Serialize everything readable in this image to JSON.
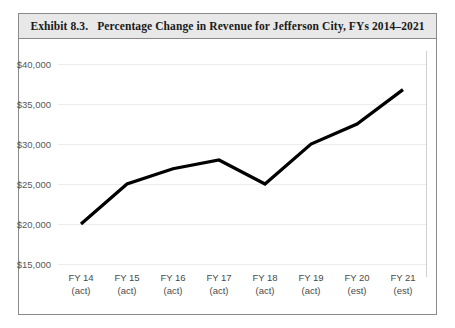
{
  "exhibit": {
    "label": "Exhibit 8.3.",
    "title": "Percentage Change in Revenue for Jefferson City, FYs 2014–2021"
  },
  "colors": {
    "title_band_background": "#e8e8e8",
    "frame_border": "#8a8a8a",
    "plot_background": "#ffffff",
    "gridline": "#ededed",
    "line_series": "#000000",
    "axis_text": "#4a4a4a"
  },
  "chart_data": {
    "type": "line",
    "title": "Percentage Change in Revenue for Jefferson City, FYs 2014–2021",
    "xlabel": "",
    "ylabel": "",
    "categories": [
      "FY 14 (act)",
      "FY 15 (act)",
      "FY 16 (act)",
      "FY 17 (act)",
      "FY 18 (act)",
      "FY 19 (act)",
      "FY 20 (est)",
      "FY 21 (est)"
    ],
    "x_tick_labels": [
      {
        "year": "FY 14",
        "basis": "(act)"
      },
      {
        "year": "FY 15",
        "basis": "(act)"
      },
      {
        "year": "FY 16",
        "basis": "(act)"
      },
      {
        "year": "FY 17",
        "basis": "(act)"
      },
      {
        "year": "FY 18",
        "basis": "(act)"
      },
      {
        "year": "FY 19",
        "basis": "(act)"
      },
      {
        "year": "FY 20",
        "basis": "(est)"
      },
      {
        "year": "FY 21",
        "basis": "(est)"
      }
    ],
    "values": [
      20000,
      25000,
      26900,
      28000,
      25000,
      30000,
      32500,
      36800
    ],
    "ylim": [
      15000,
      40000
    ],
    "y_ticks": [
      40000,
      35000,
      30000,
      25000,
      20000,
      15000
    ],
    "y_tick_labels": [
      "$40,000",
      "$35,000",
      "$30,000",
      "$25,000",
      "$20,000",
      "$15,000"
    ],
    "grid": true,
    "legend": false,
    "legend_position": "none"
  }
}
